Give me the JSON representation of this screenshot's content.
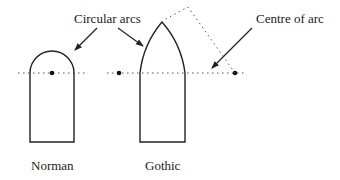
{
  "diagram": {
    "labels": {
      "circular_arcs": "Circular arcs",
      "centre_of_arc": "Centre of arc",
      "norman": "Norman",
      "gothic": "Gothic"
    },
    "colors": {
      "stroke": "#222222",
      "dotted": "#555555",
      "background": "#ffffff"
    },
    "shapes": {
      "norman_arch": {
        "type": "round-arch",
        "left": 30,
        "right": 74,
        "springline_y": 73,
        "bottom": 142,
        "center": [
          52,
          73
        ]
      },
      "gothic_arch": {
        "type": "pointed-arch",
        "left": 140,
        "right": 185,
        "springline_y": 73,
        "bottom": 142,
        "apex": [
          162,
          22
        ],
        "arc_centres": [
          [
            119,
            73
          ],
          [
            235,
            73
          ]
        ]
      }
    }
  }
}
